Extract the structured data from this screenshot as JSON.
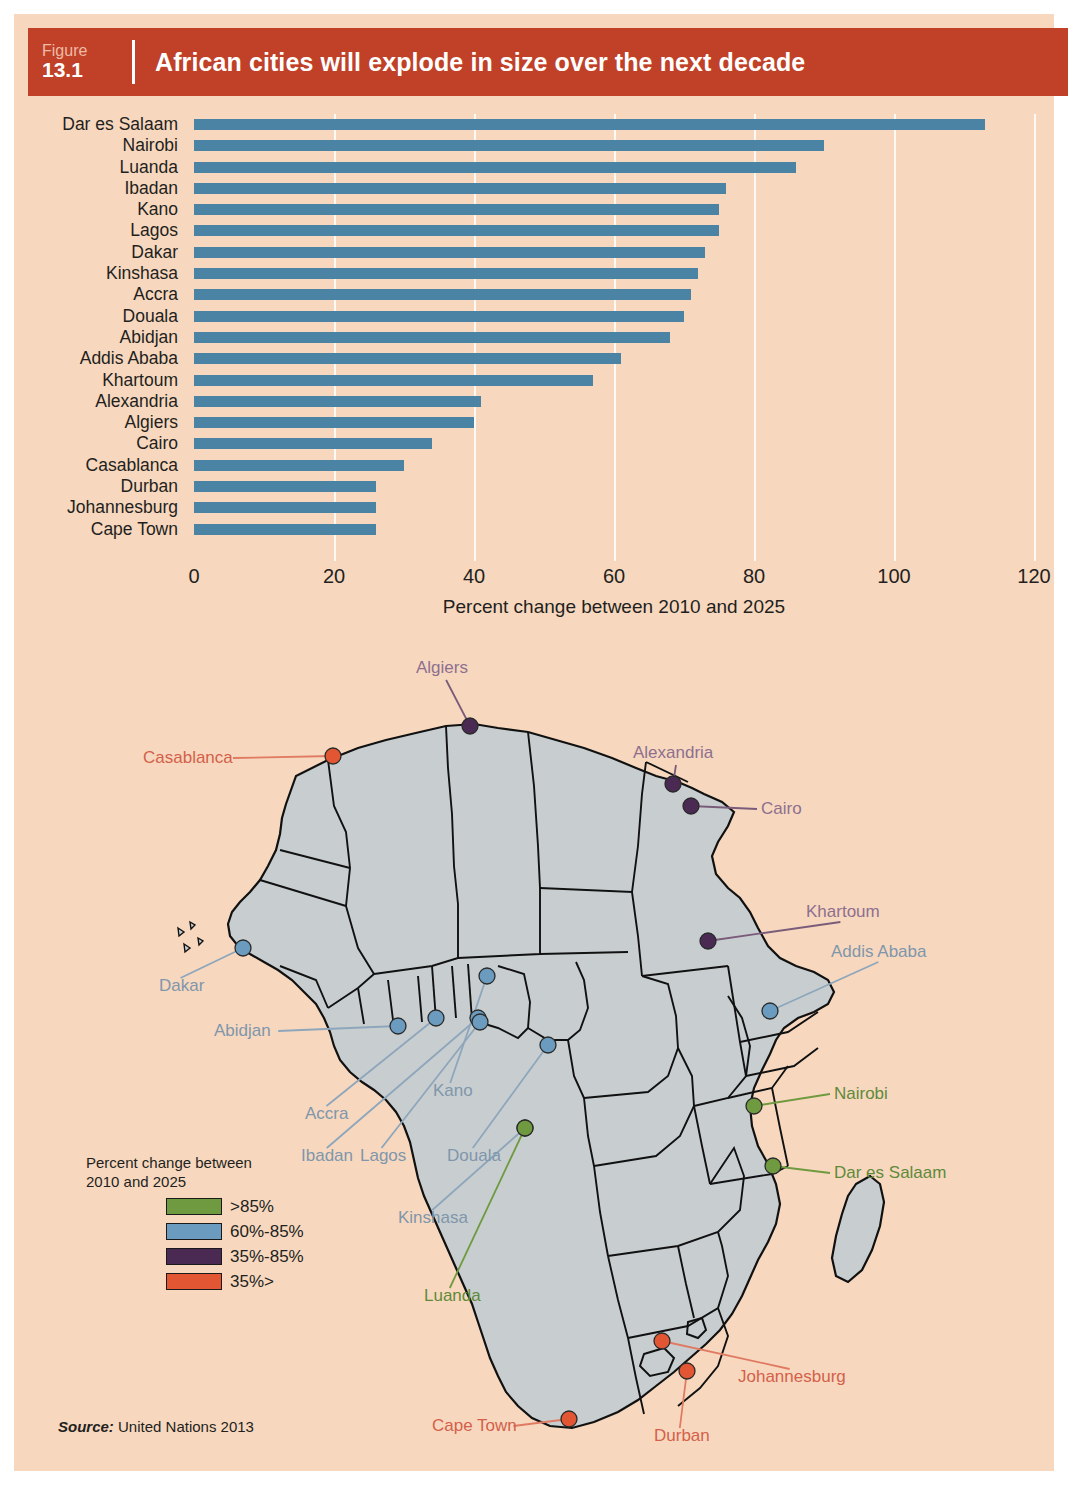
{
  "header": {
    "figure_word": "Figure",
    "figure_number": "13.1",
    "title": "African cities will explode in size over the next decade",
    "bar_color": "#c04128"
  },
  "chart_data": {
    "type": "bar",
    "orientation": "horizontal",
    "title": "African cities will explode in size over the next decade",
    "xlabel": "Percent change between 2010 and 2025",
    "ylabel": "",
    "xlim": [
      0,
      120
    ],
    "xticks": [
      "0",
      "20",
      "40",
      "60",
      "80",
      "100",
      "120"
    ],
    "grid": true,
    "series_color": "#4b83a4",
    "categories": [
      "Dar es Salaam",
      "Nairobi",
      "Luanda",
      "Ibadan",
      "Kano",
      "Lagos",
      "Dakar",
      "Kinshasa",
      "Accra",
      "Douala",
      "Abidjan",
      "Addis Ababa",
      "Khartoum",
      "Alexandria",
      "Algiers",
      "Cairo",
      "Casablanca",
      "Durban",
      "Johannesburg",
      "Cape Town"
    ],
    "values": [
      113,
      90,
      86,
      76,
      75,
      75,
      73,
      72,
      71,
      70,
      68,
      61,
      57,
      41,
      40,
      34,
      30,
      26,
      26,
      26
    ]
  },
  "map": {
    "land_color": "#c8ced0",
    "ocean_color": "#f7d8bf",
    "cities": [
      {
        "name": "Algiers",
        "category": "purple",
        "label_x": 388,
        "label_y": 22,
        "dot_x": 442,
        "dot_y": 90,
        "leader": "v"
      },
      {
        "name": "Casablanca",
        "category": "red",
        "label_x": 115,
        "label_y": 112,
        "dot_x": 305,
        "dot_y": 120,
        "leader": "h"
      },
      {
        "name": "Alexandria",
        "category": "purple",
        "label_x": 605,
        "label_y": 107,
        "dot_x": 645,
        "dot_y": 148,
        "leader": "v"
      },
      {
        "name": "Cairo",
        "category": "purple",
        "label_x": 733,
        "label_y": 163,
        "dot_x": 663,
        "dot_y": 170,
        "leader": "h"
      },
      {
        "name": "Khartoum",
        "category": "purple",
        "label_x": 778,
        "label_y": 266,
        "dot_x": 680,
        "dot_y": 305,
        "leader": "d"
      },
      {
        "name": "Addis Ababa",
        "category": "blue",
        "label_x": 803,
        "label_y": 306,
        "dot_x": 742,
        "dot_y": 375,
        "leader": "d"
      },
      {
        "name": "Dakar",
        "category": "blue",
        "label_x": 131,
        "label_y": 340,
        "dot_x": 215,
        "dot_y": 312,
        "leader": "d"
      },
      {
        "name": "Abidjan",
        "category": "blue",
        "label_x": 186,
        "label_y": 385,
        "dot_x": 370,
        "dot_y": 390,
        "leader": "h"
      },
      {
        "name": "Accra",
        "category": "blue",
        "label_x": 277,
        "label_y": 468,
        "dot_x": 408,
        "dot_y": 382,
        "leader": "d"
      },
      {
        "name": "Kano",
        "category": "blue",
        "label_x": 405,
        "label_y": 445,
        "dot_x": 459,
        "dot_y": 340,
        "leader": "d"
      },
      {
        "name": "Ibadan",
        "category": "blue",
        "label_x": 273,
        "label_y": 510,
        "dot_x": 450,
        "dot_y": 382,
        "leader": "d"
      },
      {
        "name": "Lagos",
        "category": "blue",
        "label_x": 332,
        "label_y": 510,
        "dot_x": 452,
        "dot_y": 386,
        "leader": "d"
      },
      {
        "name": "Douala",
        "category": "blue",
        "label_x": 419,
        "label_y": 510,
        "dot_x": 520,
        "dot_y": 409,
        "leader": "d"
      },
      {
        "name": "Kinshasa",
        "category": "blue",
        "label_x": 370,
        "label_y": 572,
        "dot_x": 497,
        "dot_y": 492,
        "leader": "d"
      },
      {
        "name": "Nairobi",
        "category": "green",
        "label_x": 806,
        "label_y": 448,
        "dot_x": 726,
        "dot_y": 470,
        "leader": "h"
      },
      {
        "name": "Dar es Salaam",
        "category": "green",
        "label_x": 806,
        "label_y": 527,
        "dot_x": 745,
        "dot_y": 530,
        "leader": "h"
      },
      {
        "name": "Luanda",
        "category": "green",
        "label_x": 396,
        "label_y": 650,
        "dot_x": 497,
        "dot_y": 492,
        "leader": "d"
      },
      {
        "name": "Johannesburg",
        "category": "red",
        "label_x": 710,
        "label_y": 731,
        "dot_x": 634,
        "dot_y": 705,
        "leader": "d"
      },
      {
        "name": "Durban",
        "category": "red",
        "label_x": 626,
        "label_y": 790,
        "dot_x": 659,
        "dot_y": 735,
        "leader": "d"
      },
      {
        "name": "Cape Town",
        "category": "red",
        "label_x": 404,
        "label_y": 780,
        "dot_x": 541,
        "dot_y": 783,
        "leader": "h"
      }
    ]
  },
  "legend": {
    "title_line1": "Percent change between",
    "title_line2": "2010 and 2025",
    "items": [
      {
        "label": ">85%",
        "color": "#6f9a3f"
      },
      {
        "label": "60%-85%",
        "color": "#6b9cc0"
      },
      {
        "label": "35%-85%",
        "color": "#4a2a52"
      },
      {
        "label": "35%>",
        "color": "#e25634"
      }
    ]
  },
  "source": {
    "label": "Source:",
    "text": "United Nations 2013"
  }
}
